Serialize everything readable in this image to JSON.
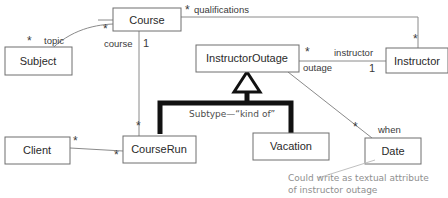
{
  "diagram": {
    "classes": [
      {
        "id": "course",
        "label": "Course",
        "x": 113,
        "y": 8,
        "w": 68,
        "h": 23
      },
      {
        "id": "subject",
        "label": "Subject",
        "x": 5,
        "y": 47,
        "w": 67,
        "h": 28
      },
      {
        "id": "instructor_outage",
        "label": "InstructorOutage",
        "x": 196,
        "y": 45,
        "w": 103,
        "h": 27
      },
      {
        "id": "instructor",
        "label": "Instructor",
        "x": 386,
        "y": 48,
        "w": 62,
        "h": 25
      },
      {
        "id": "client",
        "label": "Client",
        "x": 5,
        "y": 137,
        "w": 65,
        "h": 27
      },
      {
        "id": "course_run",
        "label": "CourseRun",
        "x": 123,
        "y": 136,
        "w": 73,
        "h": 27
      },
      {
        "id": "vacation",
        "label": "Vacation",
        "x": 253,
        "y": 133,
        "w": 76,
        "h": 27
      },
      {
        "id": "date",
        "label": "Date",
        "x": 365,
        "y": 138,
        "w": 56,
        "h": 26
      }
    ],
    "role_labels": [
      {
        "id": "topic",
        "text": "topic",
        "x": 44,
        "y": 44
      },
      {
        "id": "course",
        "text": "course",
        "x": 111,
        "y": 44
      },
      {
        "id": "qualifications",
        "text": "qualifications",
        "x": 194,
        "y": 12
      },
      {
        "id": "instructor",
        "text": "instructor",
        "x": 334,
        "y": 53
      },
      {
        "id": "outage",
        "text": "outage",
        "x": 303,
        "y": 69
      },
      {
        "id": "when",
        "text": "when",
        "x": 378,
        "y": 130
      }
    ],
    "multiplicities": [
      {
        "id": "subject-star",
        "text": "*",
        "x": 27,
        "y": 43
      },
      {
        "id": "course-star",
        "text": "*",
        "x": 105,
        "y": 30
      },
      {
        "id": "course-one",
        "text": "1",
        "x": 143,
        "y": 47
      },
      {
        "id": "qualifications-star",
        "text": "*",
        "x": 186,
        "y": 12
      },
      {
        "id": "instructor-top-star",
        "text": "*",
        "x": 415,
        "y": 41
      },
      {
        "id": "outage-star",
        "text": "*",
        "x": 307,
        "y": 53
      },
      {
        "id": "instructor-one",
        "text": "1",
        "x": 371,
        "y": 70
      },
      {
        "id": "courserun-top-star",
        "text": "*",
        "x": 139,
        "y": 127
      },
      {
        "id": "client-star",
        "text": "*",
        "x": 74,
        "y": 141
      },
      {
        "id": "courserun-left-star",
        "text": "*",
        "x": 116,
        "y": 156
      },
      {
        "id": "date-star",
        "text": "*",
        "x": 355,
        "y": 128
      }
    ],
    "subtype_box": {
      "label": "Subtype—“kind of”",
      "label_x": 189,
      "label_y": 117
    },
    "note": {
      "line1": "Could write as textual attribute",
      "line2": "of instructor outage",
      "x": 288,
      "y1": 181,
      "y2": 193
    },
    "colors": {
      "background": "#ffffff",
      "box_stroke": "#6e6e6e",
      "line": "#8a8a8a",
      "heavy": "#111111",
      "note_text": "#8f8f8f",
      "subtype_text": "#4d4d4d"
    }
  }
}
